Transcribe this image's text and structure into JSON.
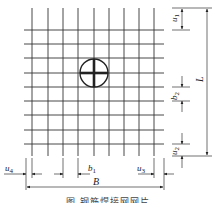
{
  "diagram": {
    "title": "钢筋焊接网网片",
    "caption": "图      钢筋焊接网网片",
    "grid": {
      "vertical_lines_x": [
        32,
        48,
        63,
        78,
        94,
        109,
        124,
        139,
        154
      ],
      "horizontal_lines_y": [
        30,
        44,
        58,
        73,
        87,
        101,
        115,
        130,
        144
      ],
      "x_min": 24,
      "x_max": 164,
      "y_min": 8,
      "y_max": 156,
      "line_color": "#333333"
    },
    "center_mark": {
      "cx": 94,
      "cy": 73,
      "r": 14,
      "label": "weld-joint"
    },
    "dimensions": {
      "u1": {
        "label": "u",
        "sub": "1"
      },
      "b2": {
        "label": "b",
        "sub": "2"
      },
      "u2": {
        "label": "u",
        "sub": "2"
      },
      "L": {
        "label": "L"
      },
      "u4": {
        "label": "u",
        "sub": "4"
      },
      "b1": {
        "label": "b",
        "sub": "1"
      },
      "u3": {
        "label": "u",
        "sub": "3"
      },
      "B": {
        "label": "B"
      }
    }
  }
}
